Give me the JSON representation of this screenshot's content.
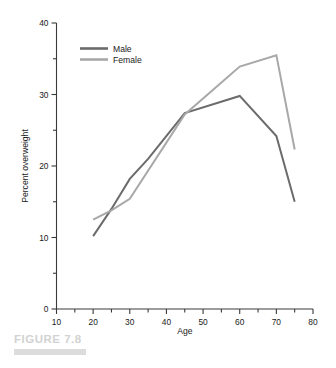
{
  "figure": {
    "caption": "FIGURE 7.8",
    "caption_color": "#d2d2d2",
    "rule_color": "#dcdcdc"
  },
  "chart_data": {
    "type": "line",
    "title": "",
    "xlabel": "Age",
    "ylabel": "Percent overweight",
    "xlim": [
      10,
      80
    ],
    "ylim": [
      0,
      40
    ],
    "grid": false,
    "legend_position": "top-left-inside",
    "x_ticks_major": [
      10,
      20,
      30,
      40,
      50,
      60,
      70,
      80
    ],
    "x_ticks_minor": [
      15,
      25,
      35,
      45,
      55,
      65,
      75
    ],
    "y_ticks_major": [
      0,
      10,
      20,
      30,
      40
    ],
    "y_ticks_minor": [
      5,
      15,
      25,
      35
    ],
    "x_tick_labels": [
      "10",
      "20",
      "30",
      "40",
      "50",
      "60",
      "70",
      "80"
    ],
    "y_tick_labels": [
      "0",
      "10",
      "20",
      "30",
      "40"
    ],
    "series": [
      {
        "name": "Male",
        "color": "#6b6b6b",
        "x": [
          20,
          25,
          30,
          35,
          45,
          60,
          70,
          75
        ],
        "values": [
          10.2,
          14.0,
          18.2,
          21.0,
          27.4,
          29.8,
          24.2,
          15.0
        ]
      },
      {
        "name": "Female",
        "color": "#a8a8a8",
        "x": [
          20,
          25,
          30,
          45,
          60,
          70,
          75
        ],
        "values": [
          12.5,
          13.8,
          15.4,
          27.2,
          33.9,
          35.5,
          22.3
        ]
      }
    ],
    "legend": [
      {
        "label": "Male",
        "color": "#6b6b6b"
      },
      {
        "label": "Female",
        "color": "#a8a8a8"
      }
    ]
  }
}
